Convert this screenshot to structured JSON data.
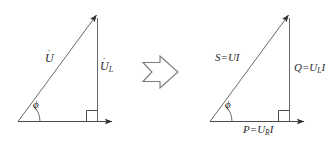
{
  "figure": {
    "stroke_color": "#4a4a4a",
    "text_color": "#2b2b2b",
    "background_color": "#ffffff"
  },
  "left_diagram": {
    "name": "voltage-phasor-triangle",
    "hypotenuse_label": "U",
    "hypotenuse_dot": "˙",
    "vertical_label": "U",
    "vertical_dot": "˙",
    "vertical_subscript": "L",
    "angle_label": "ϕ",
    "right_angle_marker": "right-angle"
  },
  "transform_arrow": {
    "name": "implies-arrow",
    "glyph": "⇒",
    "direction": "right"
  },
  "right_diagram": {
    "name": "power-triangle",
    "hypotenuse_label": "S=UI",
    "hypotenuse_parts": {
      "symbol": "S",
      "equals": "=",
      "expression": "UI"
    },
    "vertical_label": "Q=U",
    "vertical_subscript": "L",
    "vertical_suffix": "I",
    "horizontal_label": "P=U",
    "horizontal_subscript": "R",
    "horizontal_suffix": "I",
    "angle_label": "ϕ",
    "right_angle_marker": "right-angle"
  }
}
